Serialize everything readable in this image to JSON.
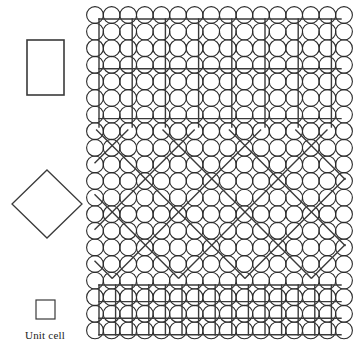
{
  "figure": {
    "background_color": "#ffffff",
    "line_color": "#3a3a3a",
    "circle_stroke_color": "#2b2b2b",
    "text_color": "#1a1a1a",
    "width": 354,
    "height": 356
  },
  "legend": {
    "caption": "Unit cell",
    "shapes": [
      {
        "name": "rectangle-unit-cell",
        "type": "rectangle",
        "x": 27,
        "y": 40,
        "width": 37,
        "height": 55
      },
      {
        "name": "diamond-unit-cell",
        "type": "diamond",
        "cx": 47,
        "cy": 204,
        "half_width": 35,
        "half_height": 34
      },
      {
        "name": "square-unit-cell",
        "type": "square",
        "x": 36,
        "y": 300,
        "width": 19,
        "height": 19
      }
    ]
  },
  "lattice": {
    "name": "circle-packing-lattice",
    "origin_x": 95,
    "origin_y": 15,
    "spacing": 16.6,
    "columns": 16,
    "rows": 21,
    "circle_radius": 8.4,
    "stroke_width": 1.1
  },
  "overlays": [
    {
      "name": "top-rectangular-overlay",
      "type": "rectangular-grid",
      "description": "Coarse rectangular unit cells over the top band",
      "x_start": 99,
      "x_end": 341,
      "y_start": 19,
      "y_end": 127,
      "column_step": 33.2,
      "row_step": 49.8,
      "stroke_width": 1.4
    },
    {
      "name": "middle-diamond-overlay",
      "type": "diagonal-lattice",
      "description": "45 degree diamond unit cells over the middle band",
      "x_start": 95,
      "x_end": 345,
      "y_start": 130,
      "y_end": 278,
      "diagonal_step": 66.4,
      "stroke_width": 1.4
    },
    {
      "name": "bottom-square-overlay",
      "type": "square-grid",
      "description": "Fine square unit cells over the bottom band",
      "x_start": 99,
      "x_end": 341,
      "y_start": 285,
      "y_end": 335,
      "column_step": 16.6,
      "row_step": 16.6,
      "stroke_width": 1.4
    }
  ]
}
